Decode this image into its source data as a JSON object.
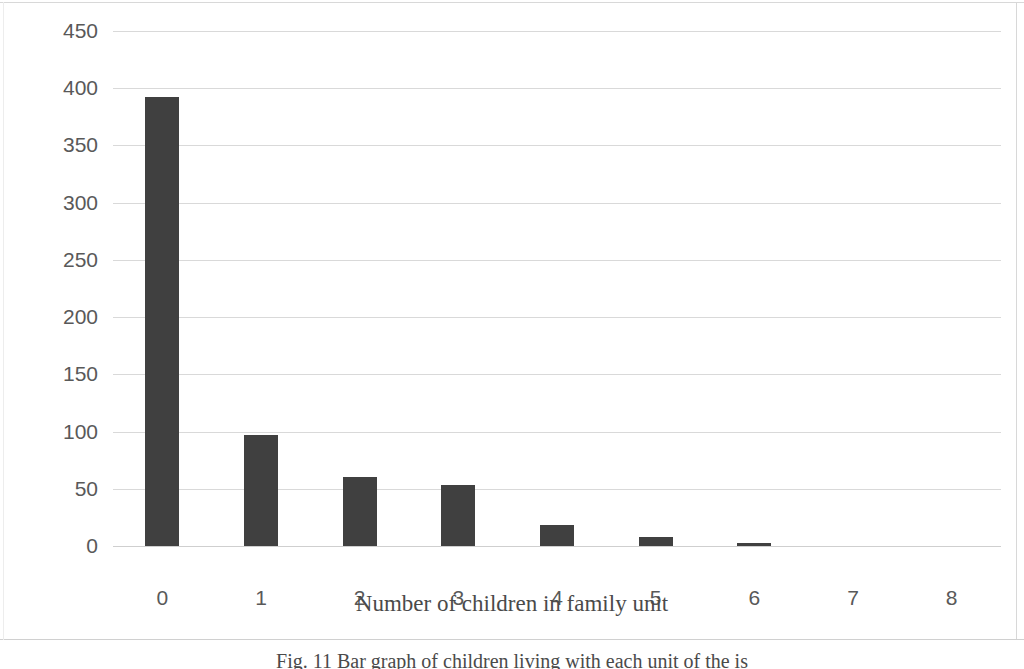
{
  "chart_data": {
    "type": "bar",
    "title": "",
    "subtitle": "",
    "xlabel": "Number of children in family unit",
    "ylabel": "Number of families",
    "categories": [
      "0",
      "1",
      "2",
      "3",
      "4",
      "5",
      "6",
      "7",
      "8"
    ],
    "values": [
      392,
      97,
      60,
      53,
      18,
      8,
      3,
      0,
      0
    ],
    "series": [
      {
        "name": "Number of families",
        "values": [
          392,
          97,
          60,
          53,
          18,
          8,
          3,
          0,
          0
        ]
      }
    ],
    "ylim": [
      0,
      450
    ],
    "ytick_labels": [
      "0",
      "50",
      "100",
      "150",
      "200",
      "250",
      "300",
      "350",
      "400",
      "450"
    ],
    "ytick_values": [
      0,
      50,
      100,
      150,
      200,
      250,
      300,
      350,
      400,
      450
    ],
    "xtick_labels": [
      "0",
      "1",
      "2",
      "3",
      "4",
      "5",
      "6",
      "7",
      "8"
    ],
    "grid": "horizontal",
    "legend": "none",
    "bar_color": "#404040",
    "gridline_color": "#d9d9d9",
    "tick_label_color": "#595959",
    "axis_title_color": "#4a4a4a",
    "background_color": "#ffffff",
    "annotations": []
  },
  "figure": {
    "caption": "Fig. 11  Bar graph of children living with each unit of the is"
  }
}
